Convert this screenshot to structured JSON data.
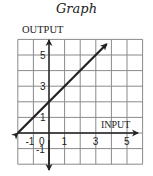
{
  "title": "Graph",
  "chart_data": {
    "type": "line",
    "title": "Graph",
    "xlabel": "INPUT",
    "ylabel": "OUTPUT",
    "xlim": [
      -2,
      6
    ],
    "ylim": [
      -2,
      6
    ],
    "grid": true,
    "x_tick_labels": [
      "-1",
      "0",
      "1",
      "3",
      "5"
    ],
    "y_tick_labels": [
      "5",
      "3",
      "1",
      "-1"
    ],
    "series": [
      {
        "name": "y = x + 2",
        "x": [
          -2,
          -1,
          0,
          1,
          2,
          3,
          3.7
        ],
        "y": [
          0,
          1,
          2,
          3,
          4,
          5,
          5.7
        ],
        "arrows": "both ends"
      }
    ],
    "legend": "none"
  },
  "axes": {
    "x_label": "INPUT",
    "y_label": "OUTPUT",
    "x_ticks": [
      {
        "value": -1,
        "label": "-1"
      },
      {
        "value": 0,
        "label": "0"
      },
      {
        "value": 1,
        "label": "1"
      },
      {
        "value": 3,
        "label": "3"
      },
      {
        "value": 5,
        "label": "5"
      }
    ],
    "y_ticks": [
      {
        "value": 5,
        "label": "5"
      },
      {
        "value": 3,
        "label": "3"
      },
      {
        "value": 1,
        "label": "1"
      },
      {
        "value": -1,
        "label": "-1"
      }
    ]
  },
  "colors": {
    "ink": "#222222",
    "grid": "#8a8a8a",
    "background": "#ffffff"
  }
}
